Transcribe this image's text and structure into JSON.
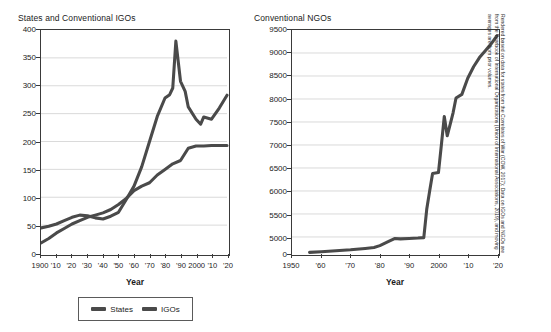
{
  "figure": {
    "source_note": "Rendered based on data for states from the Correlates of War (COW, 2017); Data on IGOs and NGOs are from the Yearbook of International Organizations (Union of International Associations, 2019), and moving averages are from prior volumes."
  },
  "legend": {
    "states_label": "States",
    "igos_label": "IGOs"
  },
  "chart_data": [
    {
      "id": "states-igos",
      "type": "line",
      "title": "States and Conventional IGOs",
      "xlabel": "Year",
      "ylabel": "",
      "xlim": [
        1900,
        2020
      ],
      "ylim": [
        0,
        400
      ],
      "grid": true,
      "legend_position": "bottom",
      "yticks": [
        0,
        50,
        100,
        150,
        200,
        250,
        300,
        350,
        400
      ],
      "ytick_labels": [
        "0",
        "50",
        "100",
        "150",
        "200",
        "250",
        "300",
        "350",
        "400"
      ],
      "xticks": [
        1900,
        1910,
        1920,
        1930,
        1940,
        1950,
        1960,
        1970,
        1980,
        1990,
        2000,
        2010,
        2020
      ],
      "xtick_labels": [
        "1900",
        "'10",
        "'20",
        "'30",
        "'40",
        "'50",
        "'60",
        "'70",
        "'80",
        "'90",
        "2000",
        "'10",
        "'20"
      ],
      "series": [
        {
          "name": "States",
          "color": "#4a4a4a",
          "x": [
            1900,
            1905,
            1910,
            1915,
            1920,
            1925,
            1930,
            1935,
            1940,
            1945,
            1950,
            1955,
            1960,
            1965,
            1970,
            1975,
            1980,
            1985,
            1990,
            1995,
            2000,
            2005,
            2010,
            2015,
            2020
          ],
          "y": [
            18,
            26,
            36,
            44,
            52,
            58,
            64,
            68,
            72,
            78,
            87,
            98,
            112,
            120,
            126,
            140,
            150,
            160,
            166,
            188,
            192,
            192,
            193,
            193,
            193
          ]
        },
        {
          "name": "IGOs",
          "color": "#4a4a4a",
          "x": [
            1900,
            1905,
            1910,
            1915,
            1920,
            1925,
            1930,
            1935,
            1940,
            1945,
            1950,
            1955,
            1960,
            1965,
            1970,
            1975,
            1980,
            1983,
            1985,
            1987,
            1990,
            1993,
            1995,
            2000,
            2003,
            2005,
            2010,
            2015,
            2020
          ],
          "y": [
            45,
            48,
            52,
            58,
            64,
            68,
            67,
            63,
            61,
            66,
            73,
            96,
            120,
            155,
            200,
            245,
            278,
            284,
            296,
            380,
            308,
            290,
            262,
            240,
            231,
            244,
            240,
            260,
            283
          ]
        }
      ]
    },
    {
      "id": "ngos",
      "type": "line",
      "title": "Conventional NGOs",
      "xlabel": "Year",
      "ylabel": "",
      "xlim": [
        1950,
        2020
      ],
      "ylim": [
        0,
        9500
      ],
      "grid": true,
      "axis_break": true,
      "yticks": [
        0,
        5000,
        5500,
        6000,
        6500,
        7000,
        7500,
        8000,
        8500,
        9000,
        9500
      ],
      "ytick_labels": [
        "0",
        "5000",
        "5500",
        "6000",
        "6500",
        "7000",
        "7500",
        "8000",
        "8500",
        "9000",
        "9500"
      ],
      "xticks": [
        1950,
        1960,
        1970,
        1980,
        1990,
        2000,
        2010,
        2020
      ],
      "xtick_labels": [
        "1950",
        "'60",
        "'70",
        "'80",
        "'90",
        "2000",
        "'10",
        "'20"
      ],
      "series": [
        {
          "name": "NGOs",
          "color": "#4a4a4a",
          "x": [
            1956,
            1960,
            1965,
            1970,
            1975,
            1978,
            1980,
            1983,
            1985,
            1987,
            1990,
            1993,
            1995,
            1996,
            1997,
            1998,
            2000,
            2001,
            2002,
            2003,
            2004,
            2005,
            2006,
            2008,
            2010,
            2012,
            2014,
            2016,
            2018,
            2020
          ],
          "y": [
            200,
            400,
            700,
            1000,
            1400,
            1700,
            2300,
            3600,
            4500,
            4400,
            4500,
            4650,
            4800,
            5600,
            6000,
            6380,
            6400,
            7000,
            7620,
            7200,
            7450,
            7700,
            8020,
            8100,
            8450,
            8700,
            8900,
            9050,
            9200,
            9380
          ]
        }
      ]
    }
  ]
}
